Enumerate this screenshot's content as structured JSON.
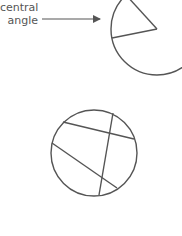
{
  "labels": {
    "line1": "central",
    "line2": "angle"
  },
  "colors": {
    "stroke": "#555555",
    "text": "#555555"
  },
  "figures": [
    {
      "name": "circle-with-central-angle",
      "cx": 157,
      "cy": 29,
      "r": 46
    },
    {
      "name": "circle-with-chords",
      "cx": 94,
      "cy": 153,
      "r": 43
    }
  ]
}
